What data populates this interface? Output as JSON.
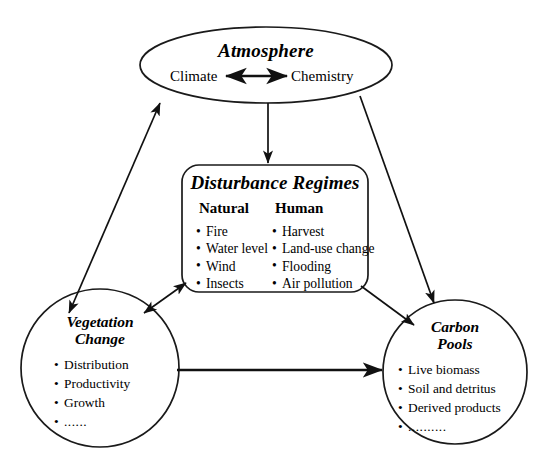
{
  "diagram": {
    "nodes": {
      "atmosphere": {
        "label": "Atmosphere",
        "left_term": "Climate",
        "right_term": "Chemistry",
        "connector_icon": "double-headed-arrow-icon"
      },
      "disturbance": {
        "label": "Disturbance Regimes",
        "columns": [
          {
            "heading": "Natural",
            "items": [
              "Fire",
              "Water level",
              "Wind",
              "Insects"
            ]
          },
          {
            "heading": "Human",
            "items": [
              "Harvest",
              "Land-use change",
              "Flooding",
              "Air pollution"
            ]
          }
        ]
      },
      "vegetation": {
        "label_line1": "Vegetation",
        "label_line2": "Change",
        "items": [
          "Distribution",
          "Productivity",
          "Growth",
          "......"
        ]
      },
      "carbon": {
        "label_line1": "Carbon",
        "label_line2": "Pools",
        "items": [
          "Live biomass",
          "Soil and detritus",
          "Derived products",
          ".........."
        ]
      }
    },
    "edges": [
      {
        "name": "atmosphere-vegetation",
        "from": "Atmosphere",
        "to": "Vegetation Change",
        "style": "double-headed"
      },
      {
        "name": "atmosphere-disturbance",
        "from": "Atmosphere",
        "to": "Disturbance Regimes",
        "style": "single-headed"
      },
      {
        "name": "atmosphere-carbon",
        "from": "Atmosphere",
        "to": "Carbon Pools",
        "style": "single-headed"
      },
      {
        "name": "disturbance-vegetation",
        "from": "Disturbance Regimes",
        "to": "Vegetation Change",
        "style": "double-headed"
      },
      {
        "name": "disturbance-carbon",
        "from": "Disturbance Regimes",
        "to": "Carbon Pools",
        "style": "single-headed"
      },
      {
        "name": "vegetation-carbon",
        "from": "Vegetation Change",
        "to": "Carbon Pools",
        "style": "single-headed"
      }
    ],
    "colors": {
      "stroke": "#1a1a1a",
      "arrow": "#111111",
      "background": "#ffffff",
      "text": "#000000"
    }
  }
}
